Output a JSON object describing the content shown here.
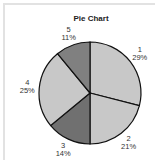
{
  "chart_data": {
    "type": "pie",
    "title": "Pie Chart",
    "categories": [
      "1",
      "2",
      "3",
      "4",
      "5"
    ],
    "values": [
      29,
      21,
      14,
      25,
      11
    ],
    "labels": [
      "29%",
      "21%",
      "14%",
      "25%",
      "11%"
    ],
    "colors": [
      "#c8c8c8",
      "#c8c8c8",
      "#707070",
      "#c8c8c8",
      "#808080"
    ],
    "start_angle": "top",
    "direction": "clockwise",
    "legend": "none"
  }
}
